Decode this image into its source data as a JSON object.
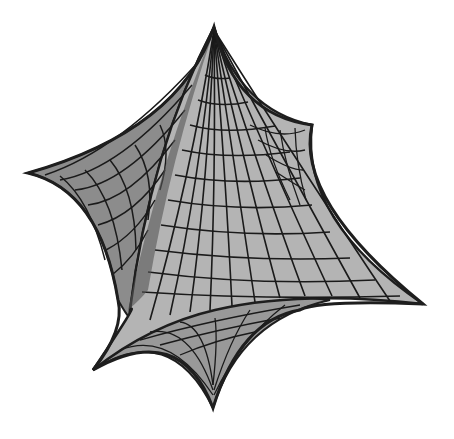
{
  "figure": {
    "background": "#ffffff",
    "colors": {
      "edge": "#1e1e1e",
      "mesh_line": "#1a1a1a",
      "front_face": "#b4b4b4",
      "left_face": "#8c8c8c",
      "back_right_face": "#d2d2d2",
      "bottom_face": "#999999",
      "ridge_shadow": "#555555"
    },
    "cusps": {
      "top": [
        214,
        27
      ],
      "upper_right": [
        312,
        125
      ],
      "left": [
        28,
        173
      ],
      "right": [
        423,
        304
      ],
      "lower_left": [
        93,
        370
      ],
      "bottom": [
        213,
        408
      ]
    }
  }
}
